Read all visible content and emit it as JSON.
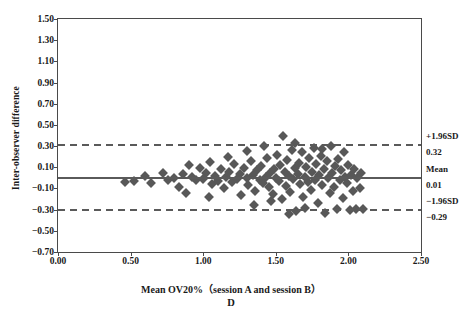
{
  "chart_data": {
    "type": "scatter",
    "title": "",
    "panel_label": "D",
    "xlabel": "Mean OV20%（session A and session B）",
    "ylabel": "Inter-observer difference",
    "xlim": [
      0.0,
      2.5
    ],
    "ylim": [
      -0.7,
      1.5
    ],
    "xticks": [
      "0.00",
      "0.50",
      "1.00",
      "1.50",
      "2.00",
      "2.50"
    ],
    "xtick_values": [
      0.0,
      0.5,
      1.0,
      1.5,
      2.0,
      2.5
    ],
    "yticks": [
      "1.50",
      "1.30",
      "1.10",
      "0.90",
      "0.70",
      "0.50",
      "0.30",
      "0.10",
      "−0.10",
      "−0.30",
      "−0.50",
      "−0.70"
    ],
    "ytick_values": [
      1.5,
      1.3,
      1.1,
      0.9,
      0.7,
      0.5,
      0.3,
      0.1,
      -0.1,
      -0.3,
      -0.5,
      -0.7
    ],
    "grid": false,
    "legend": "none",
    "reference_lines": [
      {
        "name": "upper-loa",
        "label": "+1.96SD",
        "value_label": "0.32",
        "value": 0.32,
        "style": "dashed"
      },
      {
        "name": "mean",
        "label": "Mean",
        "value_label": "0.01",
        "value": 0.01,
        "style": "solid"
      },
      {
        "name": "lower-loa",
        "label": "−1.96SD",
        "value_label": "−0.29",
        "value": -0.29,
        "style": "dashed"
      }
    ],
    "marker": {
      "shape": "diamond",
      "color": "#585858",
      "size": 7
    },
    "points": [
      [
        0.46,
        -0.04
      ],
      [
        0.52,
        -0.03
      ],
      [
        0.6,
        0.02
      ],
      [
        0.64,
        -0.05
      ],
      [
        0.72,
        0.05
      ],
      [
        0.76,
        -0.02
      ],
      [
        0.8,
        0.0
      ],
      [
        0.83,
        -0.09
      ],
      [
        0.86,
        0.04
      ],
      [
        0.88,
        -0.14
      ],
      [
        0.92,
        0.01
      ],
      [
        0.95,
        -0.02
      ],
      [
        0.98,
        0.09
      ],
      [
        1.0,
        -0.01
      ],
      [
        1.02,
        0.05
      ],
      [
        1.05,
        0.15
      ],
      [
        1.06,
        -0.06
      ],
      [
        1.08,
        0.02
      ],
      [
        1.1,
        -0.03
      ],
      [
        1.12,
        0.08
      ],
      [
        1.14,
        -0.1
      ],
      [
        1.16,
        0.01
      ],
      [
        1.18,
        0.06
      ],
      [
        1.2,
        -0.04
      ],
      [
        1.21,
        0.13
      ],
      [
        1.23,
        -0.01
      ],
      [
        1.25,
        0.04
      ],
      [
        1.26,
        -0.16
      ],
      [
        1.28,
        0.09
      ],
      [
        1.3,
        0.0
      ],
      [
        1.31,
        -0.07
      ],
      [
        1.33,
        0.16
      ],
      [
        1.34,
        0.03
      ],
      [
        1.36,
        -0.12
      ],
      [
        1.37,
        0.07
      ],
      [
        1.39,
        -0.02
      ],
      [
        1.4,
        0.11
      ],
      [
        1.41,
        -0.05
      ],
      [
        1.43,
        0.01
      ],
      [
        1.44,
        0.19
      ],
      [
        1.45,
        -0.09
      ],
      [
        1.46,
        0.05
      ],
      [
        1.48,
        -0.15
      ],
      [
        1.49,
        0.08
      ],
      [
        1.5,
        0.0
      ],
      [
        1.51,
        0.22
      ],
      [
        1.52,
        -0.03
      ],
      [
        1.53,
        0.12
      ],
      [
        1.54,
        -0.2
      ],
      [
        1.55,
        0.4
      ],
      [
        1.56,
        0.06
      ],
      [
        1.57,
        -0.08
      ],
      [
        1.58,
        0.17
      ],
      [
        1.59,
        0.02
      ],
      [
        1.6,
        -0.13
      ],
      [
        1.61,
        0.26
      ],
      [
        1.62,
        -0.01
      ],
      [
        1.63,
        0.09
      ],
      [
        1.64,
        -0.31
      ],
      [
        1.65,
        0.04
      ],
      [
        1.66,
        0.14
      ],
      [
        1.67,
        -0.06
      ],
      [
        1.68,
        0.24
      ],
      [
        1.69,
        -0.18
      ],
      [
        1.7,
        0.01
      ],
      [
        1.71,
        0.1
      ],
      [
        1.72,
        -0.04
      ],
      [
        1.73,
        0.19
      ],
      [
        1.74,
        -0.11
      ],
      [
        1.75,
        0.06
      ],
      [
        1.76,
        0.28
      ],
      [
        1.77,
        -0.02
      ],
      [
        1.78,
        0.13
      ],
      [
        1.79,
        -0.24
      ],
      [
        1.8,
        0.03
      ],
      [
        1.81,
        0.21
      ],
      [
        1.82,
        -0.07
      ],
      [
        1.83,
        0.08
      ],
      [
        1.84,
        -0.33
      ],
      [
        1.85,
        0.16
      ],
      [
        1.86,
        0.0
      ],
      [
        1.87,
        -0.14
      ],
      [
        1.88,
        0.3
      ],
      [
        1.89,
        0.05
      ],
      [
        1.9,
        -0.09
      ],
      [
        1.91,
        0.11
      ],
      [
        1.92,
        -0.29
      ],
      [
        1.93,
        0.18
      ],
      [
        1.94,
        -0.02
      ],
      [
        1.95,
        0.07
      ],
      [
        1.96,
        -0.19
      ],
      [
        1.97,
        0.24
      ],
      [
        1.98,
        0.01
      ],
      [
        1.99,
        -0.05
      ],
      [
        2.0,
        0.12
      ],
      [
        2.01,
        -0.3
      ],
      [
        2.02,
        0.03
      ],
      [
        2.03,
        -0.12
      ],
      [
        2.04,
        0.08
      ],
      [
        2.05,
        -0.29
      ],
      [
        2.06,
        0.0
      ],
      [
        2.08,
        -0.1
      ],
      [
        2.09,
        0.05
      ],
      [
        2.1,
        -0.29
      ],
      [
        1.3,
        0.25
      ],
      [
        1.35,
        -0.26
      ],
      [
        1.47,
        -0.22
      ],
      [
        1.63,
        0.33
      ],
      [
        1.7,
        -0.28
      ],
      [
        1.82,
        0.27
      ],
      [
        0.9,
        0.12
      ],
      [
        1.04,
        -0.18
      ],
      [
        1.17,
        0.2
      ],
      [
        1.42,
        0.3
      ],
      [
        1.59,
        -0.34
      ]
    ]
  }
}
